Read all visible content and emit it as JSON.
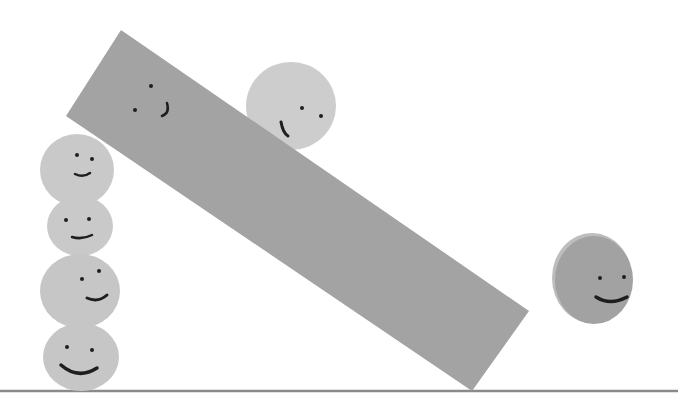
{
  "scene": {
    "width": 678,
    "height": 416,
    "background": "#ffffff",
    "ground": {
      "y": 391,
      "color": "#8a8a8a",
      "x1": 0,
      "x2": 678
    },
    "plank": {
      "points": "121,30 529,311 472,391 66,116",
      "color": "#a3a3a3",
      "face": {
        "eyes": [
          [
            151,
            86
          ],
          [
            135,
            110
          ]
        ],
        "mouth": "M167,103 Q170,113 162,116"
      }
    },
    "balls": [
      {
        "id": "ball-top-resting",
        "cx": 291,
        "cy": 106,
        "rx": 45,
        "ry": 44,
        "color": "#cdcdcd",
        "eyes": [
          [
            302,
            108
          ],
          [
            321,
            116
          ]
        ],
        "mouth": "M281,122 Q283,133 288,136",
        "mouth_width": 3
      },
      {
        "id": "stack-ball-1",
        "cx": 77,
        "cy": 170,
        "rx": 37,
        "ry": 36,
        "color": "#c9c9c9",
        "eyes": [
          [
            77,
            155
          ],
          [
            92,
            159
          ]
        ],
        "mouth": "M75,174 Q83,178 90,173",
        "mouth_width": 2.5
      },
      {
        "id": "stack-ball-2",
        "cx": 80,
        "cy": 226,
        "rx": 33,
        "ry": 30,
        "color": "#c9c9c9",
        "eyes": [
          [
            66,
            220
          ],
          [
            89,
            219
          ]
        ],
        "mouth": "M72,237 Q82,240 92,235",
        "mouth_width": 2.5
      },
      {
        "id": "stack-ball-3",
        "cx": 80,
        "cy": 291,
        "rx": 40,
        "ry": 37,
        "color": "#c6c6c6",
        "eyes": [
          [
            82,
            279
          ],
          [
            99,
            271
          ]
        ],
        "mouth": "M87,298 Q98,303 107,295",
        "mouth_width": 3
      },
      {
        "id": "stack-ball-4",
        "cx": 81,
        "cy": 357,
        "rx": 38,
        "ry": 34,
        "color": "#c6c6c6",
        "eyes": [
          [
            67,
            347
          ],
          [
            92,
            350
          ]
        ],
        "mouth": "M61,365 Q78,380 97,368",
        "mouth_width": 3.5
      },
      {
        "id": "ball-right-rolling",
        "cx": 594,
        "cy": 280,
        "rx": 39,
        "ry": 44,
        "color": "#a2a2a2",
        "rim": "#bdbdbd",
        "eyes": [
          [
            600,
            278
          ],
          [
            624,
            277
          ]
        ],
        "mouth": "M596,297 Q610,306 627,297",
        "mouth_width": 3.5
      }
    ],
    "face_color": "#1e1e1e"
  }
}
